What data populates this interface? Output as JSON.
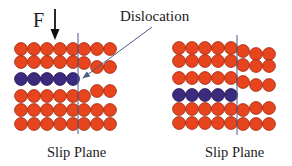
{
  "labels": {
    "force": "F",
    "dislocation": "Dislocation",
    "slip_plane_left": "Slip Plane",
    "slip_plane_right": "Slip Plane"
  },
  "colors": {
    "atom": "#E8441E",
    "atom_stroke": "#9A2A10",
    "extra_half_plane": "#3B2A7E",
    "extra_half_plane_stroke": "#1E144A",
    "line": "#4A5A8A",
    "text": "#222222"
  },
  "diagrams": [
    {
      "name": "before-slip",
      "description": "Edge dislocation with extra half-plane (purple row) left of slip plane, force F applied from top",
      "rows": [
        {
          "left_atoms": 5,
          "right_atoms": 3,
          "type": "atom"
        },
        {
          "left_atoms": 5,
          "right_atoms": 3,
          "type": "atom",
          "right_distorted": true
        },
        {
          "left_atoms": 5,
          "right_atoms": 0,
          "type": "extra_half_plane"
        },
        {
          "left_atoms": 5,
          "right_atoms": 3,
          "type": "atom",
          "right_distorted": true
        },
        {
          "left_atoms": 5,
          "right_atoms": 3,
          "type": "atom"
        },
        {
          "left_atoms": 5,
          "right_atoms": 3,
          "type": "atom"
        }
      ]
    },
    {
      "name": "after-slip",
      "description": "Dislocation moved; extra half-plane shifted down one row",
      "rows": [
        {
          "left_atoms": 5,
          "right_atoms": 3,
          "type": "atom"
        },
        {
          "left_atoms": 5,
          "right_atoms": 3,
          "type": "atom"
        },
        {
          "left_atoms": 5,
          "right_atoms": 3,
          "type": "atom"
        },
        {
          "left_atoms": 5,
          "right_atoms": 0,
          "type": "extra_half_plane"
        },
        {
          "left_atoms": 5,
          "right_atoms": 3,
          "type": "atom"
        },
        {
          "left_atoms": 5,
          "right_atoms": 3,
          "type": "atom"
        }
      ]
    }
  ]
}
